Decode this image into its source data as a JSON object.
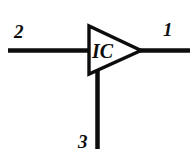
{
  "diagram": {
    "type": "electronic-schematic",
    "background_color": "#ffffff",
    "line_color": "#0d0d0d",
    "component": {
      "shape": "triangle",
      "label": "IC",
      "orientation": "points-right"
    },
    "pins": [
      {
        "id": "pin-1",
        "number": "1",
        "side": "right",
        "description": "output lead to the right of the triangle apex"
      },
      {
        "id": "pin-2",
        "number": "2",
        "side": "left",
        "description": "input lead to the left of the triangle base"
      },
      {
        "id": "pin-3",
        "number": "3",
        "side": "bottom",
        "description": "lead running down from the triangle base"
      }
    ]
  }
}
